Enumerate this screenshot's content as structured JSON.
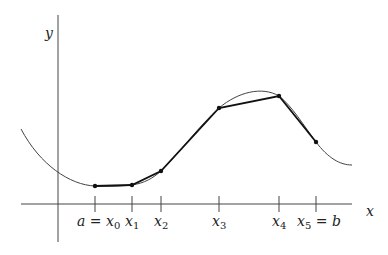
{
  "diagram": {
    "axes": {
      "x_label": "x",
      "y_label": "y"
    },
    "partition_labels": [
      {
        "id": "x0",
        "main": "a = x",
        "sub": "0",
        "suffix": ""
      },
      {
        "id": "x1",
        "main": "x",
        "sub": "1",
        "suffix": ""
      },
      {
        "id": "x2",
        "main": "x",
        "sub": "2",
        "suffix": ""
      },
      {
        "id": "x3",
        "main": "x",
        "sub": "3",
        "suffix": ""
      },
      {
        "id": "x4",
        "main": "x",
        "sub": "4",
        "suffix": ""
      },
      {
        "id": "x5",
        "main": "x",
        "sub": "5",
        "suffix": " = b"
      }
    ],
    "points_px": [
      {
        "x": 95,
        "y": 186
      },
      {
        "x": 132,
        "y": 185
      },
      {
        "x": 161,
        "y": 171
      },
      {
        "x": 219,
        "y": 108
      },
      {
        "x": 279,
        "y": 96
      },
      {
        "x": 316,
        "y": 142
      }
    ],
    "colors": {
      "axis": "#444444",
      "curve": "#444444",
      "polyline": "#111111",
      "text": "#222222"
    }
  }
}
